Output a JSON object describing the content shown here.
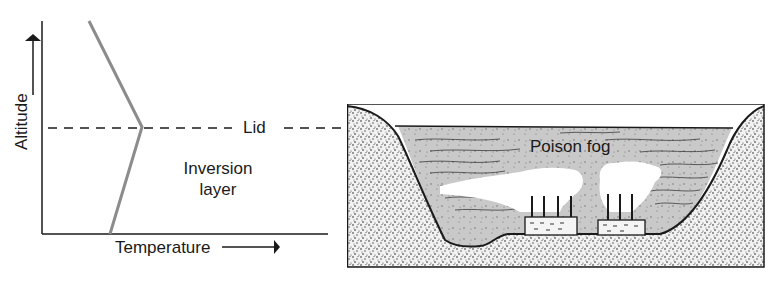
{
  "graph": {
    "y_axis_label": "Altitude",
    "x_axis_label": "Temperature",
    "lid_label": "Lid",
    "inversion_label_line1": "Inversion",
    "inversion_label_line2": "layer",
    "profile_color": "#8c8c8c",
    "axis_color": "#1a1a1a"
  },
  "valley": {
    "fog_label": "Poison fog",
    "fog_color": "#c9c9c9",
    "ground_color": "#e4e4e4",
    "smoke_color": "#ffffff",
    "factories": [
      {
        "name": "factory-left",
        "chimneys": 4
      },
      {
        "name": "factory-right",
        "chimneys": 3
      }
    ]
  }
}
